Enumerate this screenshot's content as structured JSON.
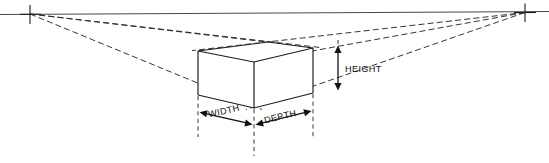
{
  "diagram": {
    "labels": {
      "height": "HEIGHT",
      "width": "WIDTH",
      "depth": "DEPTH"
    },
    "colors": {
      "line": "#1a1a1a",
      "horizon": "#4a4a4a",
      "guide": "#2b2b2b",
      "background": "#ffffff"
    },
    "geometry": {
      "horizon": {
        "x1": 0,
        "y1": 14.5,
        "x2": 549,
        "y2": 11.5
      },
      "vanishing_points": [
        {
          "name": "left-vanishing-point",
          "x": 30,
          "y": 14
        },
        {
          "name": "right-vanishing-point",
          "x": 525,
          "y": 12.5
        }
      ],
      "box": {
        "front_corner_top": {
          "x": 254,
          "y": 62
        },
        "front_corner_bottom": {
          "x": 254,
          "y": 108
        },
        "left_top": {
          "x": 198,
          "y": 51
        },
        "left_bottom": {
          "x": 198,
          "y": 95
        },
        "right_top": {
          "x": 313,
          "y": 48
        },
        "right_bottom": {
          "x": 313,
          "y": 93
        },
        "back_top": {
          "x": 268,
          "y": 42
        }
      },
      "measure_verticals": [
        {
          "name": "left-measure-line",
          "x": 198,
          "y1": 95,
          "y2": 137
        },
        {
          "name": "center-measure-line",
          "x": 254,
          "y1": 108,
          "y2": 156
        },
        {
          "name": "right-measure-line",
          "x": 313,
          "y1": 93,
          "y2": 137
        }
      ],
      "height_arrow": {
        "x": 338,
        "y_top": 47,
        "y_bottom": 89
      },
      "width_arrow": {
        "x1": 202,
        "y1": 113,
        "x2": 250,
        "y2": 124
      },
      "depth_arrow": {
        "x1": 258,
        "y1": 124,
        "x2": 309,
        "y2": 112
      }
    }
  }
}
